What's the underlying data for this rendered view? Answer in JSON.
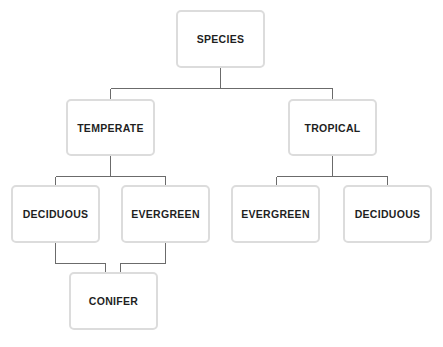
{
  "diagram": {
    "type": "tree",
    "colors": {
      "node_border": "#dcdcdc",
      "node_text": "#1f1f1f",
      "connector": "#6b6b6b",
      "background": "#ffffff"
    },
    "nodes": {
      "species": {
        "label": "SPECIES"
      },
      "temperate": {
        "label": "TEMPERATE"
      },
      "tropical": {
        "label": "TROPICAL"
      },
      "temperate_deciduous": {
        "label": "DECIDUOUS"
      },
      "temperate_evergreen": {
        "label": "EVERGREEN"
      },
      "tropical_evergreen": {
        "label": "EVERGREEN"
      },
      "tropical_deciduous": {
        "label": "DECIDUOUS"
      },
      "conifer": {
        "label": "CONIFER"
      }
    },
    "edges": [
      {
        "from": "SPECIES",
        "to": "TEMPERATE"
      },
      {
        "from": "SPECIES",
        "to": "TROPICAL"
      },
      {
        "from": "TEMPERATE",
        "to": "DECIDUOUS"
      },
      {
        "from": "TEMPERATE",
        "to": "EVERGREEN"
      },
      {
        "from": "TROPICAL",
        "to": "EVERGREEN"
      },
      {
        "from": "TROPICAL",
        "to": "DECIDUOUS"
      },
      {
        "from": "DECIDUOUS",
        "to": "CONIFER"
      },
      {
        "from": "EVERGREEN",
        "to": "CONIFER"
      }
    ]
  }
}
